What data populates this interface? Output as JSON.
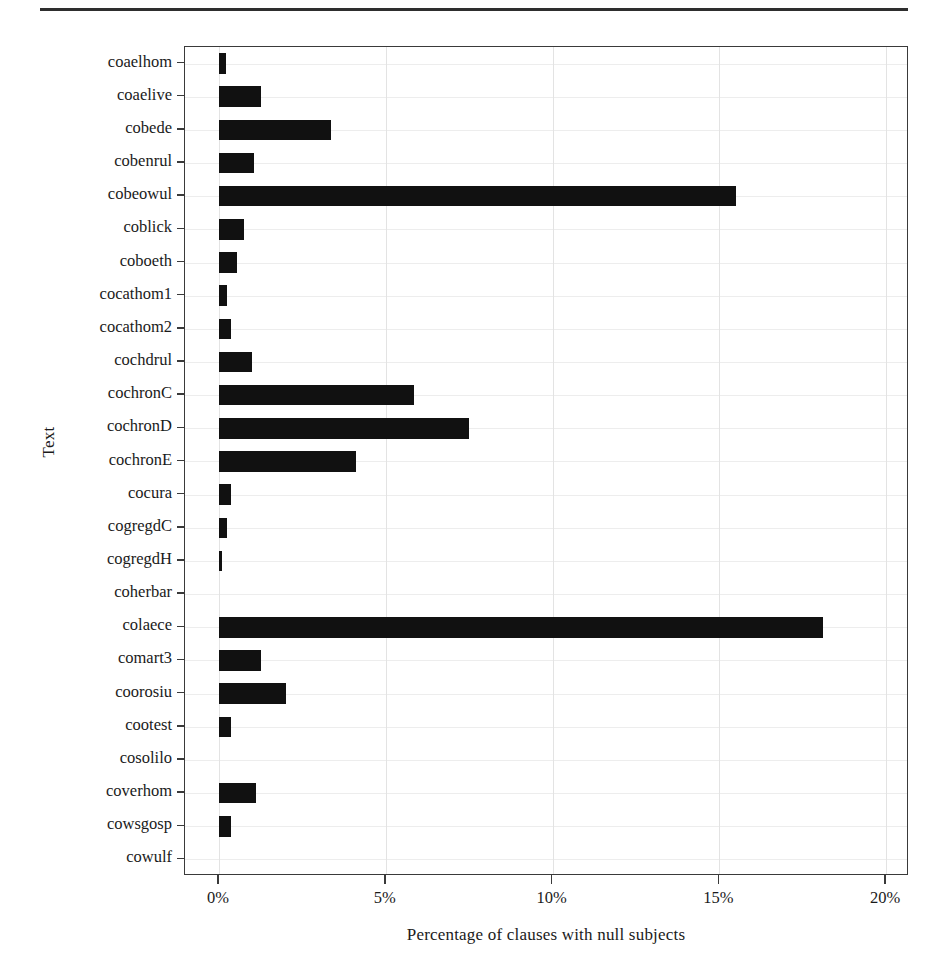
{
  "figure": {
    "has_top_rule": true,
    "background_color": "#ffffff",
    "bar_color": "#111111",
    "gridline_color": "#e3e3e3",
    "axis_color": "#3a3a3a"
  },
  "chart_data": {
    "type": "bar",
    "orientation": "horizontal",
    "title": "",
    "xlabel": "Percentage of clauses with null subjects",
    "ylabel": "Text",
    "xlim": [
      0,
      20
    ],
    "ylim": null,
    "grid": true,
    "legend": null,
    "xticks": [
      0,
      5,
      10,
      15,
      20
    ],
    "xticklabels": [
      "0%",
      "5%",
      "10%",
      "15%",
      "20%"
    ],
    "categories": [
      "coaelhom",
      "coaelive",
      "cobede",
      "cobenrul",
      "cobeowul",
      "coblick",
      "coboeth",
      "cocathom1",
      "cocathom2",
      "cochdrul",
      "cochronC",
      "cochronD",
      "cochronE",
      "cocura",
      "cogregdC",
      "cogregdH",
      "coherbar",
      "colaece",
      "comart3",
      "coorosiu",
      "cootest",
      "cosolilo",
      "coverhom",
      "cowsgosp",
      "cowulf"
    ],
    "values": [
      0.2,
      1.25,
      3.35,
      1.05,
      15.5,
      0.75,
      0.55,
      0.25,
      0.35,
      1.0,
      5.85,
      7.5,
      4.1,
      0.35,
      0.25,
      0.1,
      0.0,
      18.1,
      1.25,
      2.0,
      0.35,
      0.0,
      1.1,
      0.35,
      0.0
    ],
    "value_unit": "%"
  }
}
